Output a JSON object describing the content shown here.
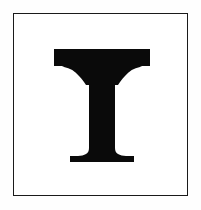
{
  "card": {
    "background_color": "#fefefe",
    "panel_color": "#ffffff",
    "border_color": "#1a1a1a",
    "border_width_px": 1.5,
    "frame": {
      "left_px": 13,
      "top_px": 13,
      "width_px": 175,
      "height_px": 183
    }
  },
  "glyph": {
    "character": "T",
    "name": "letter-t",
    "description": "Bold serif capital letter T",
    "style": "serif-bold",
    "color": "#0a0a0a",
    "alt_text": "T",
    "metrics": {
      "cap_width_px": 96,
      "cap_height_px": 113,
      "stem_width_px": 30,
      "top_bar_thickness_px": 17,
      "foot_serif_width_px": 65,
      "left_px": 55,
      "top_px": 45,
      "bottom_px": 158
    }
  }
}
